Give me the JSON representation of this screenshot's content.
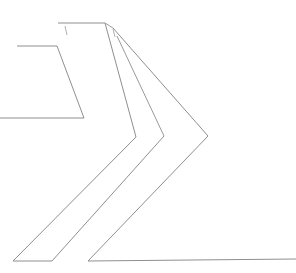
{
  "canvas": {
    "width": 296,
    "height": 273,
    "background_color": "#ffffff",
    "description": "Line-art drawing of three nested open chevron (double arrow) outlines"
  },
  "style": {
    "stroke_color": "#8a8a8a",
    "stroke_color_light": "#a9a9a9",
    "stroke_width": 1,
    "fill": "none"
  },
  "shapes": [
    {
      "id": "chevron-small-left",
      "label": "small left chevron outline",
      "stroke": "#8f8f8f",
      "width": 1,
      "points": "17,46 57,46 84,118 0,118",
      "path": "M 17 46 L 57 46 L 84 118 L 0 118"
    },
    {
      "id": "chevron-middle-upper",
      "label": "middle chevron upper arm",
      "stroke": "#8f8f8f",
      "width": 1,
      "points": "58,23 105,23 135,137",
      "path": "M 58 23 L 105 23 L 136 137"
    },
    {
      "id": "chevron-middle-lower",
      "label": "middle chevron lower arm",
      "stroke": "#8f8f8f",
      "width": 1,
      "points": "136,137 13,261 52,261 163,136",
      "path": "M 136 137 L 13 261 L 52 261 L 164 136"
    },
    {
      "id": "chevron-outer",
      "label": "large outer chevron outline",
      "stroke": "#8f8f8f",
      "width": 1,
      "points": "113,28 208,136 88,261 296,259",
      "path": "M 113 28 L 208 136 L 88 261 L 296 259"
    },
    {
      "id": "chevron-outer-upper-link",
      "label": "outer chevron upper connector from middle top edge",
      "stroke": "#9a9a9a",
      "width": 1,
      "points": "105,23 113,28",
      "path": "M 105 23 L 113 28"
    },
    {
      "id": "chevron-inner-return",
      "label": "inner return edge joining middle apex to outer",
      "stroke": "#9a9a9a",
      "width": 1,
      "points": "164,136 117,35",
      "path": "M 164 136 L 117 36"
    },
    {
      "id": "tick-left",
      "label": "short vertical tick below left end of middle top edge",
      "stroke": "#b0b0b0",
      "width": 1,
      "points": "65,26 67,35",
      "path": "M 65 26 L 67 35"
    },
    {
      "id": "tick-right",
      "label": "short vertical tick below right end of middle top edge",
      "stroke": "#b0b0b0",
      "width": 1,
      "points": "113,29 115,37",
      "path": "M 113 29 L 115 37"
    }
  ]
}
